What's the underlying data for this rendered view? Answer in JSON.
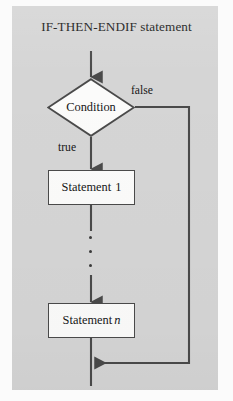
{
  "figure": {
    "title": "IF-THEN-ENDIF statement",
    "type": "flowchart",
    "background_color": "#d5d5d5",
    "page_color": "#fbfbfb",
    "line_color": "#4a4a4a",
    "node_fill_color": "#fbfbfa",
    "text_color": "#161616"
  },
  "nodes": {
    "decision": {
      "label": "Condition",
      "shape": "diamond"
    },
    "statement_first": {
      "label_text": "Statement",
      "label_index": "1",
      "shape": "rectangle"
    },
    "statement_last": {
      "label_text": "Statement",
      "label_index": "n",
      "shape": "rectangle"
    },
    "ellipsis": {
      "label": "vertical-ellipsis",
      "dot_count": 3
    }
  },
  "edges": {
    "entry": {
      "label": ""
    },
    "true_branch": {
      "label": "true"
    },
    "false_branch": {
      "label": "false"
    },
    "exit": {
      "label": ""
    }
  }
}
